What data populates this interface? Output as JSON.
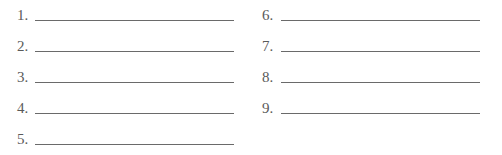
{
  "worksheet": {
    "left_column": [
      {
        "label": "1.",
        "value": ""
      },
      {
        "label": "2.",
        "value": ""
      },
      {
        "label": "3.",
        "value": ""
      },
      {
        "label": "4.",
        "value": ""
      },
      {
        "label": "5.",
        "value": ""
      }
    ],
    "right_column": [
      {
        "label": "6.",
        "value": ""
      },
      {
        "label": "7.",
        "value": ""
      },
      {
        "label": "8.",
        "value": ""
      },
      {
        "label": "9.",
        "value": ""
      }
    ]
  }
}
